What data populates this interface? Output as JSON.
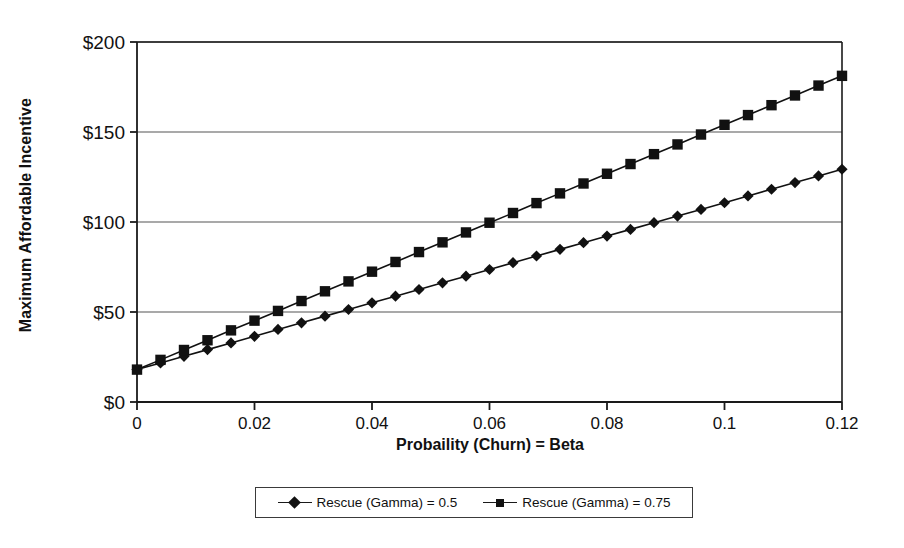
{
  "chart_data": {
    "type": "line",
    "title": "",
    "xlabel": "Probaility (Churn) = Beta",
    "ylabel": "Maximum Affordable Incentive",
    "xlim": [
      0,
      0.12
    ],
    "ylim": [
      0,
      200
    ],
    "grid": true,
    "legend_position": "bottom",
    "x_ticks": [
      "0",
      "0.02",
      "0.04",
      "0.06",
      "0.08",
      "0.1",
      "0.12"
    ],
    "x_tick_values": [
      0,
      0.02,
      0.04,
      0.06,
      0.08,
      0.1,
      0.12
    ],
    "y_ticks": [
      "$0",
      "$50",
      "$100",
      "$150",
      "$200"
    ],
    "y_tick_values": [
      0,
      50,
      100,
      150,
      200
    ],
    "x": [
      0,
      0.004,
      0.008,
      0.012,
      0.016,
      0.02,
      0.024,
      0.028,
      0.032,
      0.036,
      0.04,
      0.044,
      0.048,
      0.052,
      0.056,
      0.06,
      0.064,
      0.068,
      0.072,
      0.076,
      0.08,
      0.084,
      0.088,
      0.092,
      0.096,
      0.1,
      0.104,
      0.108,
      0.112,
      0.116,
      0.12
    ],
    "series": [
      {
        "name": "Rescue (Gamma) = 0.5",
        "marker": "diamond",
        "color": "#111111",
        "values": [
          18,
          21.7,
          25.4,
          29.1,
          32.8,
          36.5,
          40.3,
          44.0,
          47.7,
          51.4,
          55.1,
          58.8,
          62.5,
          66.2,
          69.9,
          73.6,
          77.4,
          81.1,
          84.8,
          88.5,
          92.2,
          95.9,
          99.6,
          103.3,
          107.0,
          110.7,
          114.5,
          118.2,
          121.9,
          125.6,
          129.3
        ]
      },
      {
        "name": "Rescue (Gamma) = 0.75",
        "marker": "square",
        "color": "#111111",
        "values": [
          18,
          23.4,
          28.9,
          34.3,
          39.8,
          45.2,
          50.6,
          56.1,
          61.5,
          67.0,
          72.4,
          77.8,
          83.3,
          88.7,
          94.2,
          99.6,
          105.0,
          110.5,
          115.9,
          121.4,
          126.8,
          132.2,
          137.7,
          143.1,
          148.6,
          154.0,
          159.4,
          164.9,
          170.3,
          175.8,
          181.2
        ]
      }
    ]
  },
  "legend": {
    "items": [
      {
        "label": "Rescue (Gamma) = 0.5",
        "marker": "diamond"
      },
      {
        "label": "Rescue (Gamma) = 0.75",
        "marker": "square"
      }
    ]
  },
  "axes": {
    "y_title": "Maximum Affordable Incentive",
    "x_title": "Probaility (Churn) = Beta"
  },
  "colors": {
    "axis": "#1a1a1a",
    "grid": "#555555",
    "marker": "#111111",
    "background": "#ffffff"
  }
}
